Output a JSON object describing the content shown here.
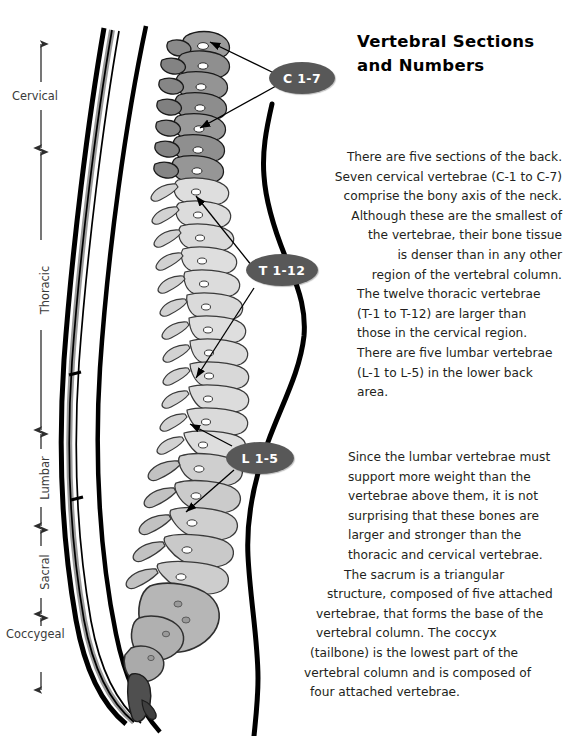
{
  "title": {
    "line1": "Vertebral Sections",
    "line2": "and Numbers"
  },
  "badges": [
    {
      "id": "cervical-badge",
      "label": "C 1-7"
    },
    {
      "id": "thoracic-badge",
      "label": "T 1-12"
    },
    {
      "id": "lumbar-badge",
      "label": "L 1-5"
    }
  ],
  "section_labels": [
    {
      "id": "cervical",
      "label": "Cervical"
    },
    {
      "id": "thoracic",
      "label": "Thoracic"
    },
    {
      "id": "lumbar",
      "label": "Lumbar"
    },
    {
      "id": "sacral",
      "label": "Sacral"
    },
    {
      "id": "coccygeal",
      "label": "Coccygeal"
    }
  ],
  "paragraphs": {
    "cervical_thoracic_lumbar": [
      "There are five sections of the back.",
      "Seven cervical vertebrae (C-1 to C-7)",
      "comprise the bony axis of the neck.",
      "Although these are the smallest of",
      "the vertebrae, their bone tissue",
      "is denser than in any other",
      "region of the vertebral column.",
      "The twelve thoracic vertebrae",
      "(T-1 to T-12) are larger than",
      "those in the cervical region.",
      "There are five lumbar vertebrae",
      "(L-1 to L-5) in the lower back",
      "area."
    ],
    "lumbar_sacrum_coccyx": [
      "Since the lumbar vertebrae must",
      "support more weight than the",
      "vertebrae above them, it is not",
      "surprising that these bones are",
      "larger and stronger than the",
      "thoracic and cervical vertebrae.",
      "The sacrum is a triangular",
      "structure, composed of five attached",
      "vertebrae, that forms the base of the",
      "vertebral column. The coccyx",
      "(tailbone) is the lowest part of the",
      "vertebral column and is composed of",
      "four attached vertebrae."
    ]
  },
  "colors": {
    "background": "#ffffff",
    "text": "#231f20",
    "badge_fill": "#585858",
    "badge_text": "#ffffff",
    "outline": "#000000",
    "cervical_bone": "#8c8c8c",
    "thoracic_bone": "#d5d5d5",
    "lumbar_bone": "#c9c9c9",
    "sacrum_bone": "#b4b4b4",
    "coccyx_bone": "#5a5a5a",
    "spinal_cord_band": "#9a9a9a",
    "ruler_line": "#4a4a4a"
  }
}
